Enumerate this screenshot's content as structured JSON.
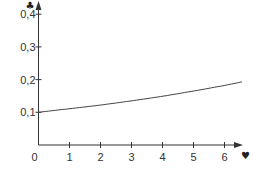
{
  "chart_data": {
    "type": "line",
    "title": "",
    "xlabel": "♥",
    "ylabel": "♣",
    "xlim": [
      0,
      6.6
    ],
    "ylim": [
      0,
      0.4
    ],
    "grid": false,
    "legend": null,
    "x_ticks": [
      "0",
      "1",
      "2",
      "3",
      "4",
      "5",
      "6"
    ],
    "y_ticks": [
      "0,1",
      "0,2",
      "0,3",
      "0,4"
    ],
    "series": [
      {
        "name": "curve",
        "color": "#444444",
        "x": [
          0,
          1,
          2,
          3,
          4,
          5,
          6,
          6.56
        ],
        "y": [
          0.1,
          0.111,
          0.122,
          0.135,
          0.149,
          0.165,
          0.182,
          0.193
        ]
      }
    ]
  },
  "axes": {
    "x_label_symbol": "♥",
    "y_label_symbol": "♣",
    "color": "#333333"
  }
}
